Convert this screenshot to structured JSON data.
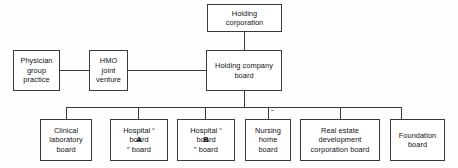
{
  "diagram": {
    "nodes": {
      "holding_corporation": "Holding corporation",
      "physician_group_practice": "Physician group practice",
      "hmo_joint_venture": "HMO joint venture",
      "holding_company_board": "Holding company board",
      "clinical_laboratory_board": "Clinical laboratory board",
      "hospital_a_board_pre": "Hospital “",
      "hospital_a_letter": "A",
      "hospital_a_board_post": "” board",
      "hospital_b_board_pre": "Hospital “",
      "hospital_b_letter": "B",
      "hospital_b_board_post": "” board",
      "nursing_home_board": "Nursing home board",
      "real_estate_development_corporation_board": "Real estate development corporation board",
      "foundation_board": "Foundation board"
    },
    "node_lines": {
      "holding_corporation": [
        "Holding",
        "corporation"
      ],
      "physician_group_practice": [
        "Physician",
        "group",
        "practice"
      ],
      "hmo_joint_venture": [
        "HMO",
        "joint",
        "venture"
      ],
      "holding_company_board": [
        "Holding company",
        "board"
      ],
      "clinical_laboratory_board": [
        "Clinical",
        "laboratory",
        "board"
      ],
      "hospital_a_board": [
        "board"
      ],
      "hospital_b_board": [
        "board"
      ],
      "nursing_home_board": [
        "Nursing",
        "home",
        "board"
      ],
      "real_estate_development_corporation_board": [
        "Real estate",
        "development",
        "corporation board"
      ],
      "foundation_board": [
        "Foundation",
        "board"
      ]
    },
    "colors": {
      "border": "#3a3a3a",
      "text": "#111111",
      "background": "#fefefe",
      "connector": "#3a3a3a"
    }
  }
}
